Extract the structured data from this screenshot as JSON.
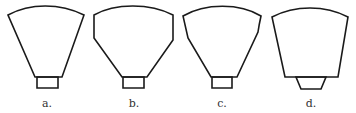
{
  "figure": {
    "stroke_color": "#1a1a1a",
    "label_color": "#333333",
    "panels": [
      {
        "id": "a",
        "label": "a.",
        "label_pos": [
          47,
          97
        ],
        "outline": "M8,15 C30,3 60,3 84,15 L62,77 L35,77 Z",
        "base": "M37,77 L58,77 L58,88 L37,88 Z"
      },
      {
        "id": "b",
        "label": "b.",
        "label_pos": [
          134,
          97
        ],
        "outline": "M94,15 C115,3 150,3 173,15 L173,40 L147,77 L122,77 L94,38 Z",
        "base": "M123,77 L144,77 L144,88 L123,88 Z"
      },
      {
        "id": "c",
        "label": "c.",
        "label_pos": [
          222,
          97
        ],
        "outline": "M183,16 C205,3 240,3 261,16 Q259,25 258,32 L237,77 L211,77 L188,38 Q185,25 183,16 Z",
        "base": "M212,77 L232,77 L232,88 L212,88 Z"
      },
      {
        "id": "d",
        "label": "d.",
        "label_pos": [
          311,
          97
        ],
        "outline": "M272,17 C295,5 325,5 348,17 L338,77 L285,77 Z",
        "base": "M296,77 L326,77 L321,89 L301,89 Z"
      }
    ]
  }
}
